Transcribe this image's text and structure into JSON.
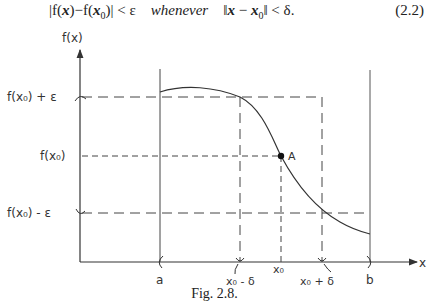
{
  "equation": {
    "lhs_open": "|f(",
    "lhs_x": "x",
    "lhs_mid": ")−f(",
    "lhs_x0": "x",
    "lhs_sub": "0",
    "lhs_close": ")| < ε",
    "word": "whenever",
    "rhs_open": "‖",
    "rhs_x": "x",
    "rhs_minus": " − ",
    "rhs_x0": "x",
    "rhs_sub": "0",
    "rhs_close": "‖ < δ.",
    "number": "(2.2)"
  },
  "figure": {
    "y_axis_label": "f(x)",
    "x_axis_label": "x",
    "y_labels": {
      "upper": "f(x₀) + ε",
      "middle": "f(x₀)",
      "lower": "f(x₀) - ε"
    },
    "x_labels": {
      "a": "a",
      "left_delta": "x₀ - δ",
      "x0": "x₀",
      "right_delta": "x₀ + δ",
      "b": "b"
    },
    "point_label": "A",
    "caption": "Fig. 2.8."
  }
}
